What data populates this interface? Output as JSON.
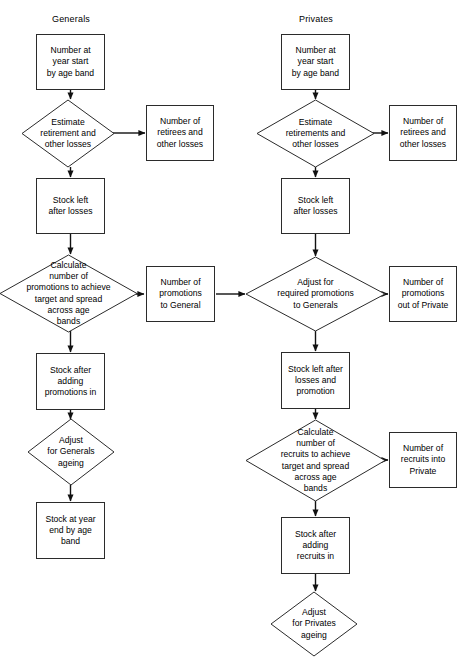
{
  "diagram": {
    "type": "flowchart",
    "columns": [
      {
        "id": "generals",
        "label": "Generals",
        "nodes": [
          {
            "id": "g1",
            "shape": "box",
            "text": "Number at\nyear start\nby age band"
          },
          {
            "id": "g2",
            "shape": "diamond",
            "text": "Estimate\nretirement and\nother losses"
          },
          {
            "id": "g2b",
            "shape": "box",
            "text": "Number of\nretirees and\nother losses"
          },
          {
            "id": "g3",
            "shape": "box",
            "text": "Stock left\nafter losses"
          },
          {
            "id": "g4",
            "shape": "diamond",
            "text": "Calculate\nnumber of\npromotions to achieve\ntarget and spread\nacross age\nbands"
          },
          {
            "id": "g4b",
            "shape": "box",
            "text": "Number of\npromotions\nto General"
          },
          {
            "id": "g5",
            "shape": "box",
            "text": "Stock after\nadding\npromotions in"
          },
          {
            "id": "g6",
            "shape": "diamond",
            "text": "Adjust\nfor Generals\nageing"
          },
          {
            "id": "g7",
            "shape": "box",
            "text": "Stock at year\nend by age\nband"
          }
        ]
      },
      {
        "id": "privates",
        "label": "Privates",
        "nodes": [
          {
            "id": "p1",
            "shape": "box",
            "text": "Number at\nyear start\nby age band"
          },
          {
            "id": "p2",
            "shape": "diamond",
            "text": "Estimate\nretirements and\nother losses"
          },
          {
            "id": "p2b",
            "shape": "box",
            "text": "Number of\nretirees and\nother losses"
          },
          {
            "id": "p3",
            "shape": "box",
            "text": "Stock left\nafter losses"
          },
          {
            "id": "p4",
            "shape": "diamond",
            "text": "Adjust for\nrequired promotions\nto Generals"
          },
          {
            "id": "p4b",
            "shape": "box",
            "text": "Number of\npromotions\nout of Private"
          },
          {
            "id": "p5",
            "shape": "box",
            "text": "Stock left after\nlosses and\npromotion"
          },
          {
            "id": "p6",
            "shape": "diamond",
            "text": "Calculate\nnumber of\nrecruits to achieve\ntarget and spread\nacross age\nbands"
          },
          {
            "id": "p6b",
            "shape": "box",
            "text": "Number of\nrecruits into\nPrivate"
          },
          {
            "id": "p7",
            "shape": "box",
            "text": "Stock after\nadding\nrecruits in"
          },
          {
            "id": "p8",
            "shape": "diamond",
            "text": "Adjust\nfor Privates\nageing"
          }
        ]
      }
    ],
    "colors": {
      "stroke": "#2b2b2b",
      "background": "#ffffff",
      "text": "#000000",
      "arrow": "#111111"
    }
  }
}
